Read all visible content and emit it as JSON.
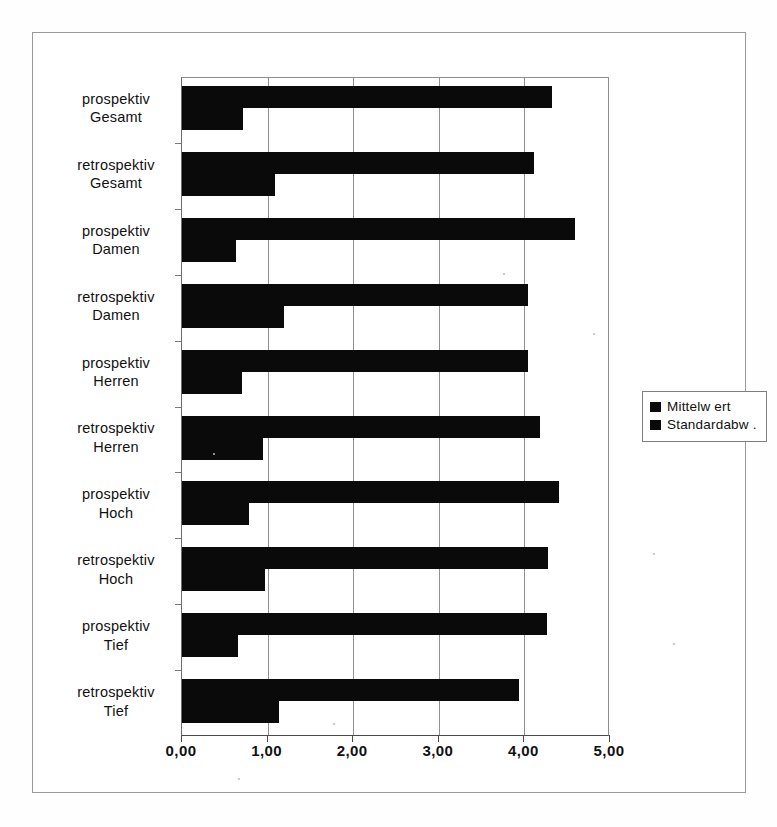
{
  "chart_data": {
    "type": "bar",
    "orientation": "horizontal",
    "title": "",
    "xlabel": "",
    "ylabel": "",
    "xlim": [
      0,
      5
    ],
    "xticks": [
      "0,00",
      "1,00",
      "2,00",
      "3,00",
      "4,00",
      "5,00"
    ],
    "xtick_values": [
      0,
      1,
      2,
      3,
      4,
      5
    ],
    "grid": true,
    "legend_position": "right",
    "categories": [
      "prospektiv Gesamt",
      "retrospektiv Gesamt",
      "prospektiv Damen",
      "retrospektiv Damen",
      "prospektiv Herren",
      "retrospektiv Herren",
      "prospektiv Hoch",
      "retrospektiv Hoch",
      "prospektiv Tief",
      "retrospektiv Tief"
    ],
    "category_lines": [
      [
        "prospektiv",
        "Gesamt"
      ],
      [
        "retrospektiv",
        "Gesamt"
      ],
      [
        "prospektiv",
        "Damen"
      ],
      [
        "retrospektiv",
        "Damen"
      ],
      [
        "prospektiv",
        "Herren"
      ],
      [
        "retrospektiv",
        "Herren"
      ],
      [
        "prospektiv",
        "Hoch"
      ],
      [
        "retrospektiv",
        "Hoch"
      ],
      [
        "prospektiv",
        "Tief"
      ],
      [
        "retrospektiv",
        "Tief"
      ]
    ],
    "series": [
      {
        "name": "Mittelw ert",
        "color": "#0a0a0a",
        "values": [
          4.32,
          4.11,
          4.59,
          4.04,
          4.04,
          4.18,
          4.4,
          4.28,
          4.26,
          3.94
        ]
      },
      {
        "name": "Standardabw .",
        "color": "#0a0a0a",
        "values": [
          0.71,
          1.09,
          0.63,
          1.19,
          0.7,
          0.95,
          0.78,
          0.97,
          0.65,
          1.13
        ]
      }
    ]
  },
  "legend": {
    "items": [
      {
        "label": "Mittelw ert"
      },
      {
        "label": "Standardabw ."
      }
    ]
  },
  "colors": {
    "bar": "#0a0a0a",
    "grid": "#8f8f8f",
    "axis": "#4a4a4a",
    "frame": "#9a9a9a",
    "background": "#ffffff"
  }
}
